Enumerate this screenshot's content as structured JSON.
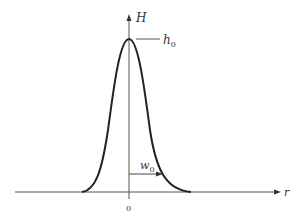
{
  "diagram": {
    "type": "gaussian-profile",
    "y_axis_label": "H",
    "x_axis_label": "r",
    "origin_label": "0",
    "peak_label": "h",
    "peak_label_sub": "0",
    "width_label": "w",
    "width_label_sub": "0",
    "colors": {
      "line": "#333333",
      "curve": "#222222",
      "background": "#ffffff"
    }
  }
}
